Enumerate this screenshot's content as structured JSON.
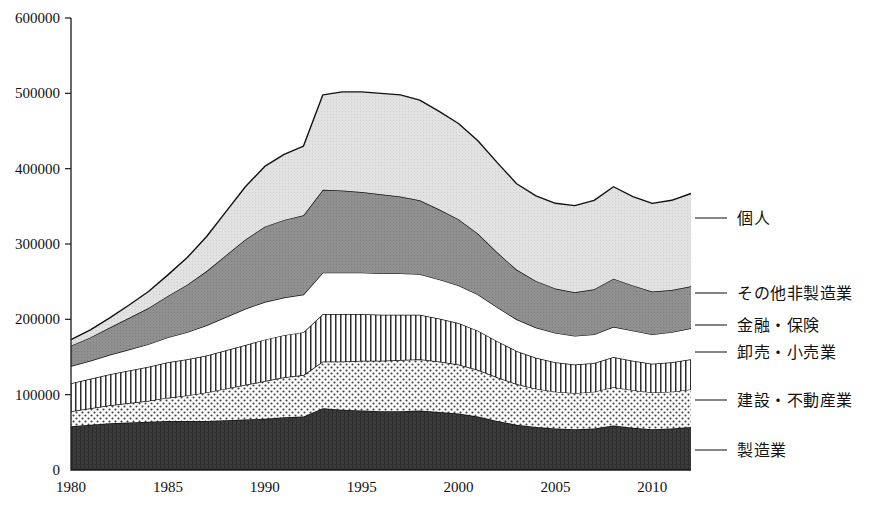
{
  "chart_data": {
    "type": "area",
    "stacked": true,
    "title": "",
    "xlabel": "",
    "ylabel": "",
    "xlim": [
      1980,
      2012
    ],
    "ylim": [
      0,
      600000
    ],
    "grid": false,
    "legend_position": "right-outside",
    "x": [
      1980,
      1981,
      1982,
      1983,
      1984,
      1985,
      1986,
      1987,
      1988,
      1989,
      1990,
      1991,
      1992,
      1993,
      1994,
      1995,
      1996,
      1997,
      1998,
      1999,
      2000,
      2001,
      2002,
      2003,
      2004,
      2005,
      2006,
      2007,
      2008,
      2009,
      2010,
      2011,
      2012
    ],
    "xtick_labels": [
      "1980",
      "1985",
      "1990",
      "1995",
      "2000",
      "2005",
      "2010"
    ],
    "xticks": [
      1980,
      1985,
      1990,
      1995,
      2000,
      2005,
      2010
    ],
    "ytick_labels": [
      "0",
      "100000",
      "200000",
      "300000",
      "400000",
      "500000",
      "600000"
    ],
    "yticks": [
      0,
      100000,
      200000,
      300000,
      400000,
      500000,
      600000
    ],
    "series": [
      {
        "name": "製造業",
        "pattern": "solid-dark",
        "color": "#3a3a3a",
        "values": [
          58000,
          60000,
          62000,
          63000,
          64000,
          65000,
          65000,
          65000,
          66000,
          67000,
          68000,
          70000,
          71000,
          82000,
          80000,
          79000,
          78000,
          78000,
          79000,
          77000,
          75000,
          71000,
          65000,
          60000,
          57000,
          55000,
          54000,
          55000,
          59000,
          56000,
          54000,
          55000,
          57000
        ]
      },
      {
        "name": "建設・不動産業",
        "pattern": "dots",
        "color": "#f2f2f2",
        "values": [
          20000,
          22000,
          24000,
          26000,
          28000,
          31000,
          34000,
          38000,
          42000,
          46000,
          50000,
          53000,
          55000,
          62000,
          64000,
          66000,
          67000,
          68000,
          68000,
          67000,
          65000,
          62000,
          58000,
          54000,
          51000,
          49000,
          48000,
          49000,
          51000,
          50000,
          49000,
          49000,
          50000
        ]
      },
      {
        "name": "卸売・小売業",
        "pattern": "vertical-stripes",
        "color": "#ffffff",
        "values": [
          37000,
          39000,
          41000,
          43000,
          45000,
          47000,
          48000,
          49000,
          51000,
          53000,
          55000,
          56000,
          57000,
          63000,
          63000,
          62000,
          61000,
          60000,
          59000,
          57000,
          55000,
          52000,
          48000,
          44000,
          41000,
          39000,
          38000,
          38000,
          40000,
          39000,
          38000,
          39000,
          40000
        ]
      },
      {
        "name": "金融・保険",
        "pattern": "white",
        "color": "#ffffff",
        "values": [
          23000,
          24000,
          26000,
          28000,
          30000,
          33000,
          36000,
          40000,
          44000,
          48000,
          50000,
          50000,
          50000,
          55000,
          55000,
          55000,
          55000,
          55000,
          54000,
          52000,
          50000,
          48000,
          45000,
          42000,
          40000,
          39000,
          38000,
          38000,
          40000,
          40000,
          39000,
          40000,
          41000
        ]
      },
      {
        "name": "その他非製造業",
        "pattern": "solid-gray",
        "color": "#8a8a8a",
        "values": [
          27000,
          31000,
          36000,
          42000,
          48000,
          55000,
          63000,
          72000,
          82000,
          92000,
          100000,
          103000,
          105000,
          110000,
          109000,
          107000,
          105000,
          102000,
          98000,
          93000,
          88000,
          81000,
          73000,
          66000,
          62000,
          59000,
          58000,
          60000,
          64000,
          60000,
          57000,
          56000,
          56000
        ]
      },
      {
        "name": "個人",
        "pattern": "light-gray",
        "color": "#dddddd",
        "values": [
          8000,
          10000,
          13000,
          17000,
          22000,
          28000,
          36000,
          46000,
          58000,
          70000,
          80000,
          87000,
          92000,
          126000,
          131000,
          133000,
          134000,
          135000,
          133000,
          130000,
          127000,
          123000,
          119000,
          114000,
          113000,
          113000,
          115000,
          118000,
          122000,
          118000,
          117000,
          119000,
          123000
        ]
      }
    ],
    "legend_entries": [
      {
        "label": "個人",
        "y_anchor": 218
      },
      {
        "label": "その他非製造業",
        "y_anchor": 293
      },
      {
        "label": "金融・保険",
        "y_anchor": 325
      },
      {
        "label": "卸売・小売業",
        "y_anchor": 352
      },
      {
        "label": "建設・不動産業",
        "y_anchor": 400
      },
      {
        "label": "製造業",
        "y_anchor": 450
      }
    ]
  },
  "plot": {
    "left": 71,
    "right": 691,
    "top": 18,
    "bottom": 470
  }
}
